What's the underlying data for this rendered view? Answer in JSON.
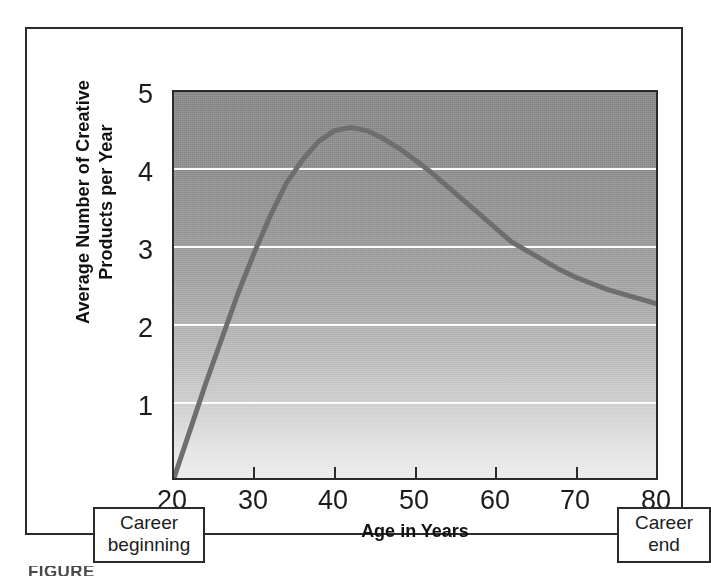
{
  "figure": {
    "background_color": "#ffffff",
    "frame_color": "#2b2b2b",
    "plot_top_color": "#8b8b8b",
    "plot_bottom_color": "#ededed",
    "gridline_color": "#fbfbfb",
    "curve_color": "#6e6e6e",
    "caption_partial": "FIGURE"
  },
  "chart_data": {
    "type": "line",
    "title": "",
    "xlabel": "Age in Years",
    "ylabel": "Average Number of Creative Products per Year",
    "ylabel_line1": "Average Number of Creative",
    "ylabel_line2": "Products per Year",
    "xlim": [
      20,
      80
    ],
    "ylim": [
      0,
      5
    ],
    "xticks": [
      20,
      30,
      40,
      50,
      60,
      70,
      80
    ],
    "xtick_labels": [
      "20",
      "30",
      "40",
      "50",
      "60",
      "70",
      "80"
    ],
    "yticks": [
      1,
      2,
      3,
      4,
      5
    ],
    "ytick_labels": [
      "1",
      "2",
      "3",
      "4",
      "5"
    ],
    "grid": "horizontal",
    "gridline_values": [
      1,
      2,
      3,
      4
    ],
    "legend": "none",
    "series": [
      {
        "name": "Average creative productivity",
        "x": [
          20,
          22,
          24,
          26,
          28,
          30,
          32,
          34,
          36,
          38,
          40,
          42,
          44,
          46,
          48,
          50,
          52,
          54,
          56,
          58,
          60,
          62,
          64,
          66,
          68,
          70,
          72,
          74,
          76,
          78,
          80
        ],
        "y": [
          0.0,
          0.62,
          1.24,
          1.82,
          2.4,
          2.92,
          3.4,
          3.82,
          4.12,
          4.36,
          4.5,
          4.54,
          4.5,
          4.4,
          4.27,
          4.12,
          3.96,
          3.78,
          3.6,
          3.42,
          3.24,
          3.06,
          2.94,
          2.82,
          2.7,
          2.6,
          2.52,
          2.44,
          2.38,
          2.32,
          2.26
        ]
      }
    ],
    "annotations": [
      {
        "id": "career-beginning",
        "line1": "Career",
        "line2": "beginning",
        "x_value": 20,
        "position": "below-axis-left"
      },
      {
        "id": "career-end",
        "line1": "Career",
        "line2": "end",
        "x_value": 80,
        "position": "below-axis-right"
      }
    ]
  }
}
